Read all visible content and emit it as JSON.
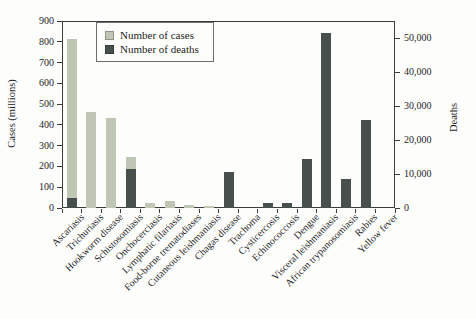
{
  "chart_data": {
    "type": "bar",
    "title": "",
    "categories": [
      "Ascariasis",
      "Trichuriasis",
      "Hookworm disease",
      "Schistosomiasis",
      "Onchocerciasis",
      "Lymphatic filariasis",
      "Food-borne trematodiases",
      "Cutaneous leishmaniasis",
      "Chagas disease",
      "Trachoma",
      "Cysticercosis",
      "Echinococcosis",
      "Dengue",
      "Visceral leishmaniasis",
      "African trypanosomiasis",
      "Rabies",
      "Yellow fever"
    ],
    "series": [
      {
        "name": "Number of cases",
        "axis": "left",
        "color": "#bfc6b3",
        "values": [
          815,
          460,
          435,
          245,
          25,
          35,
          15,
          8,
          0,
          0,
          0,
          0,
          0,
          0,
          0,
          0,
          0
        ]
      },
      {
        "name": "Number of deaths",
        "axis": "right",
        "color": "#47504c",
        "values": [
          3000,
          0,
          0,
          11500,
          0,
          0,
          0,
          0,
          10500,
          0,
          1500,
          1500,
          14500,
          51500,
          8500,
          26000,
          0
        ]
      }
    ],
    "left_axis": {
      "label": "Cases (millions)",
      "min": 0,
      "max": 900,
      "tick_step": 100,
      "tick_labels": [
        "0",
        "100",
        "200",
        "300",
        "400",
        "500",
        "600",
        "700",
        "800",
        "900"
      ]
    },
    "right_axis": {
      "label": "Deaths",
      "min": 0,
      "plot_max": 55000,
      "tick_step": 10000,
      "tick_max": 50000,
      "tick_labels": [
        "0",
        "10,000",
        "20,000",
        "30,000",
        "40,000",
        "50,000"
      ]
    },
    "legend_position": "top-left",
    "grid": false,
    "bar_style": "overlapped",
    "colors": {
      "axis_line": "#3c3c3c",
      "background": "#fdfdfc",
      "text": "#1e1e1e"
    }
  }
}
